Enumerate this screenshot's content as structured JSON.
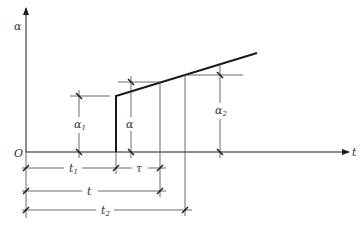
{
  "diagram": {
    "axes": {
      "y_label": "α",
      "x_label": "t",
      "origin_label": "O"
    },
    "dimension_labels": {
      "alpha1": "α",
      "alpha1_sub": "1",
      "alpha": "α",
      "alpha2": "α",
      "alpha2_sub": "2",
      "t1": "t",
      "t1_sub": "1",
      "tau": "τ",
      "t": "t",
      "t2": "t",
      "t2_sub": "2"
    },
    "colors": {
      "line": "#1a1a1a",
      "thin": "#444444",
      "background": "#ffffff"
    }
  }
}
